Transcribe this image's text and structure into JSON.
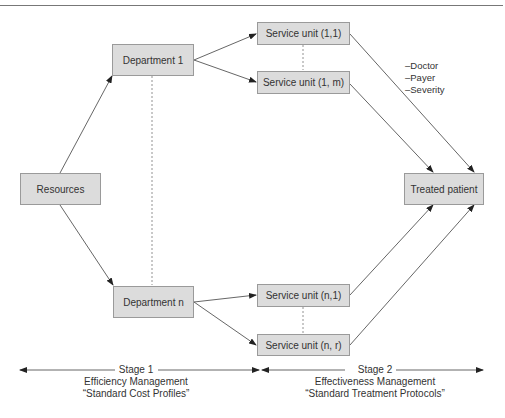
{
  "diagram": {
    "nodes": {
      "resources": "Resources",
      "department_1": "Department 1",
      "department_n": "Department n",
      "service_unit_1_1": "Service unit (1,1)",
      "service_unit_1_m": "Service unit (1, m)",
      "service_unit_n_1": "Service unit (n,1)",
      "service_unit_n_r": "Service unit (n, r)",
      "treated_patient": "Treated patient"
    },
    "factors": [
      "–Doctor",
      "–Payer",
      "–Severity"
    ],
    "stages": [
      {
        "title": "Stage 1",
        "line1": "Efficiency Management",
        "line2": "“Standard Cost Profiles”"
      },
      {
        "title": "Stage 2",
        "line1": "Effectiveness Management",
        "line2": "“Standard Treatment Protocols”"
      }
    ],
    "colors": {
      "box_fill": "#dcdcdc",
      "box_border": "#9a9a9a",
      "line": "#555555"
    }
  }
}
